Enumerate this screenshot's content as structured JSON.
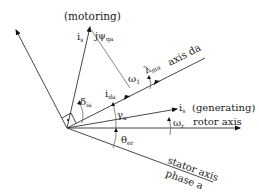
{
  "diagram": {
    "labels": {
      "motoring": "(motoring)",
      "is_motoring_main": "i",
      "is_motoring_sub": "s",
      "jpsi_main": "jψ",
      "jpsi_sub": "qa",
      "omega1_main": "ω",
      "omega1_sub": "1",
      "lambda_main": "λ",
      "lambda_sub": "ma",
      "axis_da": "axis da",
      "delta_main": "δ",
      "delta_sub": "ia",
      "ida_main": "i",
      "ida_sub": "da",
      "gamma_main": "γ",
      "gamma_sub": "a",
      "is_gen_main": "i",
      "is_gen_sub": "s",
      "generating": "(generating)",
      "omega_r_main": "ω",
      "omega_r_sub": "r",
      "rotor_axis": "rotor axis",
      "theta_main": "θ",
      "theta_sub": "er",
      "stator_axis": "stator axis",
      "phase_a": "phase a"
    },
    "colors": {
      "line": "#333333",
      "text": "#1a1a1a",
      "background": "#ffffff"
    }
  }
}
